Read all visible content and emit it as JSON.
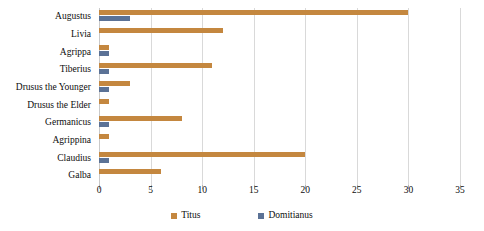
{
  "chart_data": {
    "type": "bar",
    "orientation": "horizontal",
    "title": "",
    "xlabel": "",
    "ylabel": "",
    "xlim": [
      0,
      35
    ],
    "xticks": [
      0,
      5,
      10,
      15,
      20,
      25,
      30,
      35
    ],
    "grid": true,
    "legend_position": "bottom",
    "categories": [
      "Augustus",
      "Livia",
      "Agrippa",
      "Tiberius",
      "Drusus the Younger",
      "Drusus the Elder",
      "Germanicus",
      "Agrippina",
      "Claudius",
      "Galba"
    ],
    "series": [
      {
        "name": "Titus",
        "color": "#C4873F",
        "values": [
          30,
          12,
          1,
          11,
          3,
          1,
          8,
          1,
          20,
          6
        ]
      },
      {
        "name": "Domitianus",
        "color": "#5B7296",
        "values": [
          3,
          0,
          1,
          1,
          1,
          0,
          1,
          0,
          1,
          0
        ]
      }
    ]
  },
  "axis": {
    "tick_labels": [
      "0",
      "5",
      "10",
      "15",
      "20",
      "25",
      "30",
      "35"
    ]
  },
  "legend": {
    "items": [
      {
        "label": "Titus",
        "color": "#C4873F"
      },
      {
        "label": "Domitianus",
        "color": "#5B7296"
      }
    ]
  }
}
